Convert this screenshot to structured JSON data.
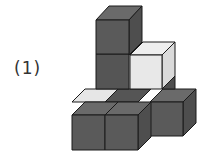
{
  "figure": {
    "label": "(1)",
    "colors": {
      "dark_front": "#5a5a5a",
      "dark_top": "#6a6a6a",
      "dark_side": "#4e4e4e",
      "light_front": "#e8e8e8",
      "light_top": "#f0f0f0",
      "light_side": "#dcdcdc",
      "edge": "#1a1a1a"
    },
    "cube_count_visible": 7
  }
}
